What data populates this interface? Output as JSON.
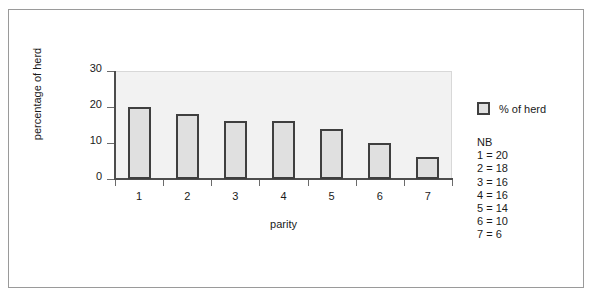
{
  "chart_data": {
    "type": "bar",
    "title": "",
    "subtitle": "",
    "xlabel": "parity",
    "ylabel": "percentage of herd",
    "categories": [
      "1",
      "2",
      "3",
      "4",
      "5",
      "6",
      "7"
    ],
    "values": [
      20,
      18,
      16,
      16,
      14,
      10,
      6
    ],
    "series": [
      {
        "name": "% of herd",
        "values": [
          20,
          18,
          16,
          16,
          14,
          10,
          6
        ]
      }
    ],
    "ylim": [
      0,
      30
    ],
    "yticks": [
      0,
      10,
      20,
      30
    ],
    "ytick_labels": [
      "0",
      "10",
      "20",
      "30"
    ],
    "grid": false,
    "legend_position": "right",
    "legend": [
      "% of herd"
    ],
    "annotations": {
      "note_title": "NB",
      "note_lines": [
        "1 = 20",
        "2 = 18",
        "3 = 16",
        "4 = 16",
        "5 = 14",
        "6 = 10",
        "7 = 6"
      ]
    },
    "colors": {
      "bar_fill": "#e0e0e0",
      "bar_border": "#3f3f3f",
      "plot_background": "#f2f2f2",
      "axis": "#4d4d4d",
      "text": "#1a1a1a",
      "frame_border": "#9a9a9a",
      "page_background": "#ffffff"
    }
  },
  "axes": {
    "y_title": "percentage of herd",
    "x_title": "parity",
    "y_ticks": [
      {
        "label": "30",
        "value": 30
      },
      {
        "label": "20",
        "value": 20
      },
      {
        "label": "10",
        "value": 10
      },
      {
        "label": "0",
        "value": 0
      }
    ],
    "x_ticks": [
      {
        "label": "1"
      },
      {
        "label": "2"
      },
      {
        "label": "3"
      },
      {
        "label": "4"
      },
      {
        "label": "5"
      },
      {
        "label": "6"
      },
      {
        "label": "7"
      }
    ]
  },
  "legend": {
    "entries": [
      {
        "label": "% of herd",
        "swatch_fill": "#e0e0e0",
        "swatch_border": "#3f3f3f"
      }
    ]
  },
  "note": {
    "title": "NB",
    "lines": [
      "1 = 20",
      "2 = 18",
      "3 = 16",
      "4 = 16",
      "5 = 14",
      "6 = 10",
      "7 = 6"
    ]
  }
}
